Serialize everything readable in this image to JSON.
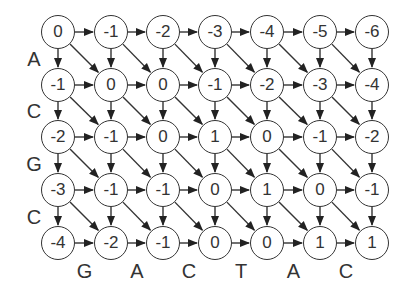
{
  "diagram": {
    "type": "alignment-score-grid",
    "row_labels": [
      "A",
      "C",
      "G",
      "C"
    ],
    "col_labels": [
      "G",
      "A",
      "C",
      "T",
      "A",
      "C"
    ],
    "grid": [
      [
        0,
        -1,
        -2,
        -3,
        -4,
        -5,
        -6
      ],
      [
        -1,
        0,
        0,
        -1,
        -2,
        -3,
        -4
      ],
      [
        -2,
        -1,
        0,
        1,
        0,
        -1,
        -2
      ],
      [
        -3,
        -1,
        -1,
        0,
        1,
        0,
        -1
      ],
      [
        -4,
        -2,
        -1,
        0,
        0,
        1,
        1
      ]
    ],
    "edges": [
      "right",
      "down",
      "diagonal"
    ],
    "colors": {
      "stroke": "#333333",
      "fill": "#ffffff"
    }
  }
}
